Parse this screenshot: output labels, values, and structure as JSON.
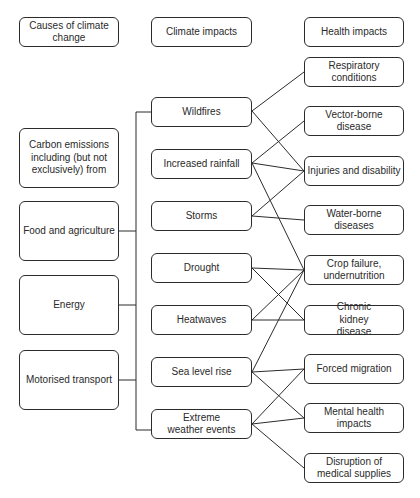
{
  "headers": {
    "causes": "Causes of climate change",
    "climate": "Climate impacts",
    "health": "Health impacts"
  },
  "causes": {
    "intro": "Carbon emissions including (but not exclusively) from",
    "items": [
      "Food and agriculture",
      "Energy",
      "Motorised transport"
    ]
  },
  "climate_impacts": [
    "Wildfires",
    "Increased rainfall",
    "Storms",
    "Drought",
    "Heatwaves",
    "Sea level rise",
    "Extreme weather events"
  ],
  "health_impacts": [
    "Respiratory conditions",
    "Vector-borne disease",
    "Injuries and disability",
    "Water-borne diseases",
    "Crop failure, undernutrition",
    "Chronic kidney disease",
    "Forced migration",
    "Mental health impacts",
    "Disruption of medical supplies"
  ],
  "links": [
    {
      "from": "Wildfires",
      "to": [
        "Respiratory conditions",
        "Injuries and disability"
      ]
    },
    {
      "from": "Increased rainfall",
      "to": [
        "Vector-borne disease",
        "Injuries and disability",
        "Crop failure, undernutrition"
      ]
    },
    {
      "from": "Storms",
      "to": [
        "Injuries and disability",
        "Water-borne diseases"
      ]
    },
    {
      "from": "Drought",
      "to": [
        "Crop failure, undernutrition",
        "Chronic kidney disease"
      ]
    },
    {
      "from": "Heatwaves",
      "to": [
        "Crop failure, undernutrition",
        "Chronic kidney disease"
      ]
    },
    {
      "from": "Sea level rise",
      "to": [
        "Crop failure, undernutrition",
        "Forced migration",
        "Mental health impacts"
      ]
    },
    {
      "from": "Extreme weather events",
      "to": [
        "Forced migration",
        "Mental health impacts",
        "Disruption of medical supplies"
      ]
    }
  ],
  "colors": {
    "line": "#2b2b2b",
    "box_border": "#2b2b2b",
    "background": "#ffffff"
  }
}
